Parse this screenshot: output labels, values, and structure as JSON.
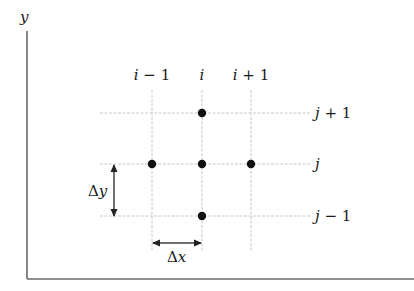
{
  "diagram": {
    "axis_labels": {
      "y": "y"
    },
    "column_labels": [
      {
        "prefix": "i",
        "suffix": " − 1"
      },
      {
        "prefix": "i",
        "suffix": ""
      },
      {
        "prefix": "i",
        "suffix": " + 1"
      }
    ],
    "row_labels": [
      {
        "prefix": "j",
        "suffix": " + 1"
      },
      {
        "prefix": "j",
        "suffix": ""
      },
      {
        "prefix": "j",
        "suffix": " − 1"
      }
    ],
    "spacing_labels": {
      "dx": {
        "delta": "Δ",
        "var": "x"
      },
      "dy": {
        "delta": "Δ",
        "var": "y"
      }
    },
    "grid_points": [
      {
        "col": "i",
        "row": "j+1"
      },
      {
        "col": "i-1",
        "row": "j"
      },
      {
        "col": "i",
        "row": "j"
      },
      {
        "col": "i+1",
        "row": "j"
      },
      {
        "col": "i",
        "row": "j-1"
      }
    ],
    "colors": {
      "grid_line": "#c8c8c8",
      "axis": "#6a6a6a",
      "point": "#111111",
      "text": "#1a1a1a"
    }
  }
}
